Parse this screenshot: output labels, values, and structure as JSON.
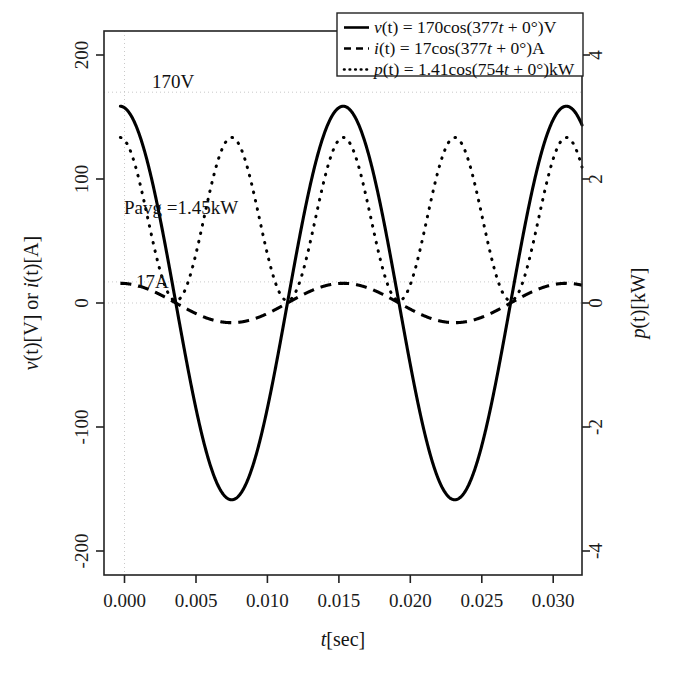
{
  "chart_data": {
    "type": "line",
    "title": "",
    "xlabel": "t[sec]",
    "ylabel": "v(t)[V] or i(t)[A]",
    "y2label": "p(t)[kW]",
    "xlim": [
      -0.0012,
      0.0345
    ],
    "ylim": [
      -235,
      235
    ],
    "y2lim": [
      -4.7,
      4.7
    ],
    "grid": "partial-dotted",
    "legend_position": "top-right",
    "xticks": [
      "0.000",
      "0.005",
      "0.010",
      "0.015",
      "0.020",
      "0.025",
      "0.030"
    ],
    "xtick_values": [
      0.0,
      0.005,
      0.01,
      0.015,
      0.02,
      0.025,
      0.03
    ],
    "yticks": [
      "200",
      "100",
      "0",
      "-100",
      "-200"
    ],
    "ytick_values": [
      200,
      100,
      0,
      -100,
      -200
    ],
    "y2ticks": [
      "4",
      "2",
      "0",
      "-2",
      "-4"
    ],
    "y2tick_values": [
      4,
      2,
      0,
      -2,
      -4
    ],
    "series": [
      {
        "name": "v(t) = 170cos(377t + 0°)V",
        "style": "solid",
        "axis": "left",
        "amplitude": 170,
        "omega": 377,
        "phase_deg": 0,
        "offset": 0,
        "units": "V"
      },
      {
        "name": "i(t) = 17cos(377t + 0°)A",
        "style": "dashed",
        "axis": "left",
        "amplitude": 17,
        "omega": 377,
        "phase_deg": 0,
        "offset": 0,
        "units": "A"
      },
      {
        "name": "p(t) = 1.41cos(754t + 0°)kW",
        "style": "dotted",
        "axis": "right",
        "amplitude": 1.41,
        "omega": 754,
        "phase_deg": 0,
        "offset": 1.45,
        "units": "kW"
      }
    ],
    "annotations": [
      {
        "text": "170V",
        "x": 0.0017,
        "y": 170,
        "axis": "left"
      },
      {
        "text": "Pavg =1.45kW",
        "x": 0.0012,
        "y": 67,
        "axis": "left"
      },
      {
        "text": "17A",
        "x": 0.0015,
        "y": 17,
        "axis": "left"
      }
    ],
    "reference_lines": [
      {
        "value": 170,
        "axis": "left",
        "orientation": "horizontal",
        "style": "dotted"
      },
      {
        "value": 17,
        "axis": "left",
        "orientation": "horizontal",
        "style": "dotted"
      },
      {
        "value": 0,
        "axis": "left",
        "orientation": "horizontal",
        "style": "dotted"
      },
      {
        "value": 0.0,
        "axis": "x",
        "orientation": "vertical",
        "style": "dotted"
      }
    ]
  },
  "legend": {
    "entries": [
      {
        "symbol": "v",
        "pre": "(t) = 170cos(377",
        "mid": "t",
        "post": " + 0°)V",
        "glyph": "solid-line-icon"
      },
      {
        "symbol": "i",
        "pre": "(t) = 17cos(377",
        "mid": "t",
        "post": " + 0°)A",
        "glyph": "dashed-line-icon"
      },
      {
        "symbol": "p",
        "pre": "(t) = 1.41cos(754",
        "mid": "t",
        "post": " + 0°)kW",
        "glyph": "dotted-line-icon"
      }
    ]
  },
  "axes": {
    "x_title_symbol": "t",
    "x_title_unit": "[sec]",
    "y_title_a": "v",
    "y_title_a_unit": "(t)[V] or ",
    "y_title_b": "i",
    "y_title_b_unit": "(t)[A]",
    "y2_title_symbol": "p",
    "y2_title_unit": "(t)[kW]"
  },
  "annotations": {
    "peak_voltage": "170V",
    "average_power": "Pavg =1.45kW",
    "peak_current": "17A"
  }
}
